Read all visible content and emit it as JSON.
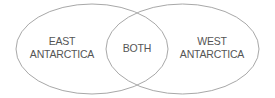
{
  "diagram": {
    "type": "venn",
    "sets": [
      {
        "id": "east",
        "lines": [
          "EAST",
          "ANTARCTICA"
        ]
      },
      {
        "id": "west",
        "lines": [
          "WEST",
          "ANTARCTICA"
        ]
      }
    ],
    "intersection": {
      "label": "BOTH"
    },
    "colors": {
      "stroke": "#a8a8a8",
      "text": "#555555",
      "background": "#ffffff"
    }
  }
}
